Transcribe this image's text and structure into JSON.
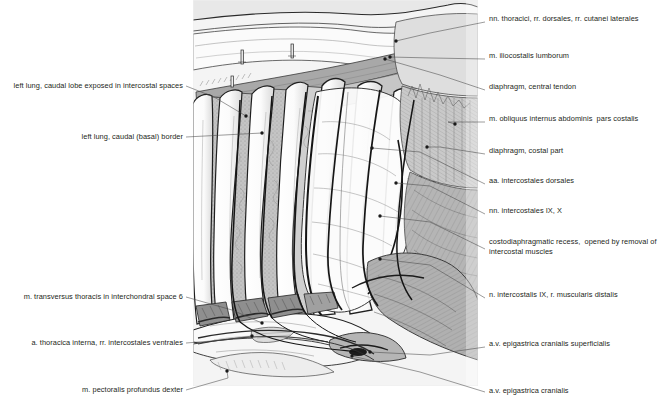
{
  "figure": {
    "kind": "anatomical-line-illustration",
    "palette": {
      "ink": "#231f20",
      "paper": "#ffffff",
      "plate_bg": "#f2f2f2",
      "muscle_mid": "#b9b9b9",
      "muscle_dark": "#9a9a9a",
      "muscle_light": "#d8d8d8",
      "rib_white": "#fdfdfd",
      "shadow": "#6e6e6e"
    },
    "plate": {
      "x": 193,
      "y": 0,
      "width": 285,
      "height": 386
    }
  },
  "labels_left": [
    {
      "id": "left-lung-caudal-lobe",
      "text": "left lung, caudal lobe exposed in intercostal spaces",
      "text_x": 183,
      "text_y": 88,
      "leader": [
        [
          186,
          86
        ],
        [
          214,
          97
        ],
        [
          246,
          116
        ]
      ],
      "dot": [
        246,
        116
      ]
    },
    {
      "id": "left-lung-caudal-basal-border",
      "text": "left lung, caudal (basal) border",
      "text_x": 183,
      "text_y": 139,
      "leader": [
        [
          186,
          137
        ],
        [
          262,
          133
        ]
      ],
      "dot": [
        262,
        133
      ]
    },
    {
      "id": "m-transversus-thoracis",
      "text": "m. transversus thoracis in interchondral space 6",
      "text_x": 183,
      "text_y": 299,
      "leader": [
        [
          186,
          297
        ],
        [
          232,
          310
        ],
        [
          262,
          323
        ]
      ],
      "dot": [
        262,
        323
      ]
    },
    {
      "id": "a-thoracica-interna",
      "text": "a. thoracica interna, rr. intercostales ventrales",
      "text_x": 183,
      "text_y": 345,
      "leader": [
        [
          186,
          343
        ],
        [
          224,
          340
        ],
        [
          252,
          336
        ]
      ],
      "dot": [
        252,
        336
      ]
    },
    {
      "id": "m-pectoralis-profundus-dexter",
      "text": "m. pectoralis profundus dexter",
      "text_x": 183,
      "text_y": 392,
      "leader": [
        [
          186,
          390
        ],
        [
          228,
          378
        ],
        [
          227,
          371
        ]
      ],
      "dot": [
        227,
        371
      ]
    }
  ],
  "labels_right": [
    {
      "id": "nn-thoracici-rr-dorsales",
      "text": "nn. thoracici, rr. dorsales, rr. cutanei laterales",
      "text_x": 489,
      "text_y": 21,
      "leader": [
        [
          485,
          22
        ],
        [
          430,
          33
        ],
        [
          396,
          41
        ]
      ],
      "dot": [
        396,
        41
      ]
    },
    {
      "id": "m-iliocostalis-lumborum",
      "text": "m. iliocostalis lumborum",
      "text_x": 489,
      "text_y": 58,
      "leader": [
        [
          485,
          59
        ],
        [
          432,
          58
        ],
        [
          390,
          57
        ]
      ],
      "dot": [
        390,
        57
      ]
    },
    {
      "id": "diaphragm-central-tendon",
      "text": "diaphragm, central tendon",
      "text_x": 489,
      "text_y": 89,
      "leader": [
        [
          485,
          90
        ],
        [
          440,
          75
        ],
        [
          385,
          59
        ]
      ],
      "dot": [
        385,
        59
      ]
    },
    {
      "id": "m-obliquus-internus-abdominis",
      "text": "m. obliquus internus abdominis  pars costalis",
      "text_x": 489,
      "text_y": 121,
      "leader": [
        [
          485,
          122
        ],
        [
          448,
          122
        ],
        [
          455,
          124
        ]
      ],
      "dot": [
        455,
        124
      ]
    },
    {
      "id": "diaphragm-costal-part",
      "text": "diaphragm, costal part",
      "text_x": 489,
      "text_y": 153,
      "leader": [
        [
          485,
          154
        ],
        [
          440,
          147
        ],
        [
          427,
          147
        ]
      ],
      "dot": [
        427,
        147
      ]
    },
    {
      "id": "aa-intercostales-dorsales",
      "text": "aa. intercostales dorsales",
      "text_x": 489,
      "text_y": 183,
      "leader": [
        [
          485,
          184
        ],
        [
          420,
          152
        ],
        [
          372,
          148
        ]
      ],
      "dot": [
        372,
        148
      ]
    },
    {
      "id": "nn-intercostales-ix-x",
      "text": "nn. intercostales IX, X",
      "text_x": 489,
      "text_y": 213,
      "leader": [
        [
          485,
          214
        ],
        [
          430,
          186
        ],
        [
          396,
          183
        ]
      ],
      "dot": [
        396,
        183
      ]
    },
    {
      "id": "costodiaphragmatic-recess",
      "text": "costodiaphragmatic recess,  opened by removal of\nintercostal muscles",
      "text_x": 489,
      "text_y": 244,
      "leader": [
        [
          485,
          249
        ],
        [
          430,
          222
        ],
        [
          380,
          216
        ]
      ],
      "dot": [
        380,
        216
      ]
    },
    {
      "id": "n-intercostalis-ix",
      "text": "n. intercostalis IX, r. muscularis distalis",
      "text_x": 489,
      "text_y": 297,
      "leader": [
        [
          485,
          298
        ],
        [
          430,
          265
        ],
        [
          380,
          259
        ]
      ],
      "dot": [
        380,
        259
      ]
    },
    {
      "id": "av-epigastrica-cranialis-superficialis",
      "text": "a.v. epigastrica cranialis superficialis",
      "text_x": 489,
      "text_y": 346,
      "leader": [
        [
          485,
          347
        ],
        [
          430,
          355
        ],
        [
          370,
          352
        ]
      ],
      "dot": [
        370,
        352
      ]
    },
    {
      "id": "av-epigastrica-cranialis",
      "text": "a.v. epigastrica cranialis",
      "text_x": 489,
      "text_y": 393,
      "leader": [
        [
          485,
          392
        ],
        [
          420,
          372
        ],
        [
          352,
          356
        ]
      ],
      "dot": [
        352,
        356
      ]
    }
  ]
}
